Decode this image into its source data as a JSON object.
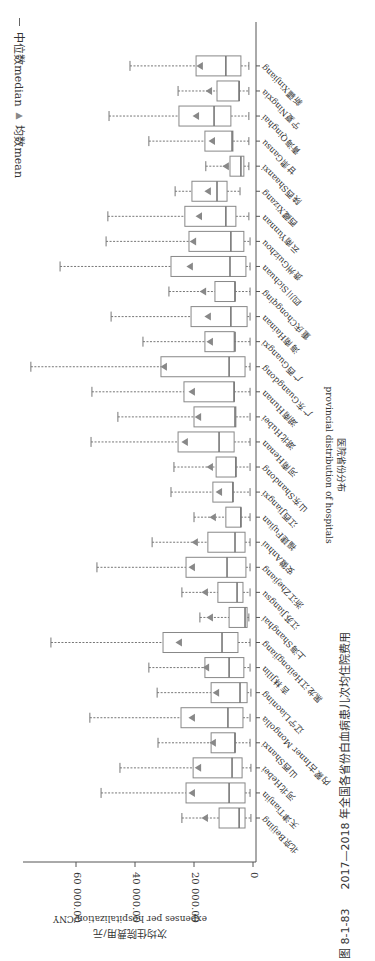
{
  "figure": {
    "caption_number": "图 8-1-83",
    "caption_title": "2017—2018 年全国各省份白血病患儿次均住院费用"
  },
  "legend": {
    "median_label": "中位数median",
    "mean_label": "均数mean"
  },
  "chart_data": {
    "type": "boxplot",
    "orientation": "rotated-90-clockwise (categories run bottom-to-top, values increase leftward)",
    "title": "2017—2018 年全国各省份白血病患儿次均住院费用",
    "xlabel": "医院省份分布",
    "xlabel_en": "provincial distribution of hospitals",
    "ylabel": "次均住院费用/元",
    "ylabel_en": "expenses per hospitalization/CNY",
    "ylim": [
      0,
      75000
    ],
    "yticks": [
      0,
      20000,
      40000,
      60000
    ],
    "ytick_labels": [
      "0",
      "20 000.00",
      "40 000.00",
      "60 000.00"
    ],
    "grid": false,
    "legend": [
      "中位数median",
      "均数mean"
    ],
    "categories": [
      "北京Beijing",
      "天津Tianjin",
      "河北Hebei",
      "山西Shanxi",
      "内蒙古Inner Mongolia",
      "辽宁Liaoning",
      "吉林Jilin",
      "黑龙江Heilongjiang",
      "上海Shanghai",
      "江苏Jiangsu",
      "浙江Zhejiang",
      "安徽Anhui",
      "福建Fujian",
      "江西Jiangxi",
      "山东Shandong",
      "河南Henan",
      "湖北Hubei",
      "湖南Hunan",
      "广东Guangdong",
      "广西Guangxi",
      "海南Hainan",
      "重庆Chongqing",
      "四川Sichuan",
      "贵州Guizhou",
      "云南Yunnan",
      "西藏Xizang",
      "陕西Shaanxi",
      "甘肃Gansu",
      "青海Qinghai",
      "宁夏Ningxia",
      "新疆Xinjiang"
    ],
    "series": [
      {
        "name": "whisker_low",
        "values": [
          700,
          1000,
          700,
          1000,
          1000,
          700,
          1000,
          1000,
          1400,
          1000,
          1000,
          1000,
          1000,
          1000,
          1000,
          1000,
          1000,
          1000,
          1000,
          1000,
          1000,
          1000,
          1000,
          1000,
          1400,
          4400,
          1400,
          1400,
          1400,
          1400,
          1400
        ]
      },
      {
        "name": "q1",
        "values": [
          2700,
          2700,
          3700,
          6100,
          3400,
          2000,
          3100,
          5100,
          2000,
          3400,
          2400,
          2700,
          4100,
          6800,
          5800,
          6400,
          5800,
          6400,
          2700,
          6400,
          2000,
          6100,
          2400,
          3100,
          5800,
          8800,
          3100,
          6800,
          7500,
          4700,
          4100
        ]
      },
      {
        "name": "median",
        "values": [
          4700,
          8100,
          7100,
          6100,
          8500,
          4400,
          8100,
          10500,
          2700,
          5400,
          8800,
          6100,
          4100,
          6800,
          5800,
          11500,
          6100,
          6400,
          8100,
          6100,
          7500,
          6100,
          7800,
          7500,
          9200,
          12200,
          4100,
          7100,
          13200,
          4700,
          9200
        ]
      },
      {
        "name": "q3",
        "values": [
          11500,
          22700,
          20300,
          14200,
          24400,
          14200,
          16300,
          30500,
          8100,
          11900,
          22700,
          15300,
          9200,
          13600,
          12500,
          25400,
          20000,
          23400,
          31200,
          16300,
          21000,
          12900,
          27800,
          21700,
          23100,
          20700,
          7800,
          16300,
          25100,
          12200,
          19300
        ]
      },
      {
        "name": "whisker_high",
        "values": [
          24100,
          51500,
          45100,
          32200,
          55300,
          32500,
          35300,
          68500,
          18000,
          24100,
          52900,
          34200,
          20000,
          27800,
          26800,
          54900,
          45800,
          54600,
          75300,
          37300,
          48100,
          28500,
          65400,
          49800,
          49200,
          26400,
          16000,
          35300,
          48800,
          25400,
          41700
        ]
      },
      {
        "name": "mean",
        "values": [
          16300,
          20700,
          18600,
          13600,
          20700,
          12500,
          15900,
          25100,
          14600,
          16300,
          20700,
          19700,
          13600,
          11500,
          14600,
          23100,
          18600,
          20700,
          30200,
          14600,
          15300,
          16900,
          21400,
          20300,
          18300,
          15300,
          9200,
          13900,
          19300,
          14900,
          18000
        ]
      }
    ]
  }
}
